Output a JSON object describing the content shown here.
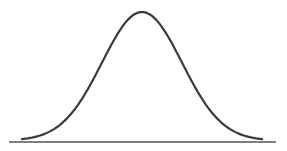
{
  "chart_data": {
    "type": "line",
    "title": "",
    "xlabel": "",
    "ylabel": "",
    "distribution": {
      "mean": 0,
      "std": 1
    },
    "x_range": [
      -3,
      3
    ],
    "series": [
      {
        "name": "normal density",
        "x": [
          -3,
          -2.5,
          -2,
          -1.5,
          -1,
          -0.5,
          0,
          0.5,
          1,
          1.5,
          2,
          2.5,
          3
        ],
        "y": [
          0.0044,
          0.0175,
          0.054,
          0.1295,
          0.242,
          0.3521,
          0.3989,
          0.3521,
          0.242,
          0.1295,
          0.054,
          0.0175,
          0.0044
        ]
      }
    ],
    "grid": false,
    "axes": {
      "x_axis_line": true,
      "y_axis_line": false,
      "ticks": false
    },
    "colors": {
      "curve": "#3a3a3a",
      "axis": "#555555"
    }
  }
}
